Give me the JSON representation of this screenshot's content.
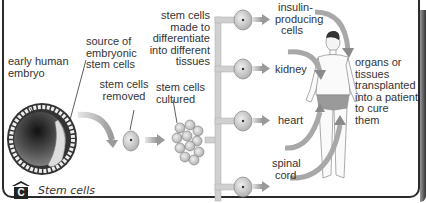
{
  "figure": {
    "caption_letter": "C",
    "caption_title": "Stem cells"
  },
  "labels": {
    "early_embryo": [
      "early human",
      "embryo"
    ],
    "source": [
      "source of",
      "embryonic",
      "stem cells"
    ],
    "removed": [
      "stem cells",
      "removed"
    ],
    "cultured": [
      "stem cells",
      "cultured"
    ],
    "differentiate": [
      "stem cells",
      "made to",
      "differentiate",
      "into different",
      "tissues"
    ],
    "insulin": [
      "insulin-",
      "producing",
      "cells"
    ],
    "kidney": "kidney",
    "heart": "heart",
    "spinal": [
      "spinal",
      "cord"
    ],
    "transplant": [
      "organs or",
      "tissues",
      "transplanted",
      "into a patient",
      "to cure",
      "them"
    ]
  },
  "colors": {
    "arrow": "#b8b8b8",
    "cell_fill": "#d4d4d4",
    "embryo_dark": "#2a2a2a",
    "border": "#2b2b2b"
  }
}
